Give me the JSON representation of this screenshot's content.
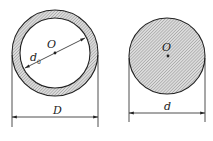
{
  "figure": {
    "colors": {
      "stroke": "#222222",
      "hatch_bg": "#dcdcdc",
      "hatch_line": "#8a8a8a",
      "background": "#ffffff"
    },
    "hollow_section": {
      "center_label": "O",
      "inner_diameter_label": "d",
      "inner_diameter_subscript": "0",
      "outer_diameter_label": "D",
      "geometry": {
        "cx": 55,
        "cy": 53,
        "outer_r": 43,
        "inner_r": 35,
        "dim_line_y": 117,
        "ext_bottom": 127
      }
    },
    "solid_section": {
      "center_label": "O",
      "diameter_label": "d",
      "geometry": {
        "cx": 167,
        "cy": 56,
        "r": 38,
        "dim_line_y": 113,
        "ext_bottom": 122
      }
    }
  }
}
